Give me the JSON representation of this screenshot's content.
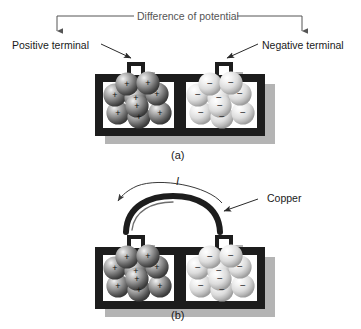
{
  "figure": {
    "title_text": "Difference of potential",
    "background_color": "#ffffff"
  },
  "panel_a": {
    "caption": "(a)",
    "bracket_label": "Difference of potential",
    "left_terminal_label": "Positive terminal",
    "right_terminal_label": "Negative terminal",
    "left_cell": {
      "charge_symbol": "+",
      "sphere_count": 9,
      "sphere_color": "#8c8c8c",
      "sphere_shade_dark": "#4a4a4a",
      "sphere_highlight": "#e8e8e8"
    },
    "right_cell": {
      "charge_symbol": "−",
      "sphere_count": 9,
      "sphere_color": "#dcdcdc",
      "sphere_shade_dark": "#9a9a9a",
      "sphere_highlight": "#ffffff"
    },
    "case_color": "#1d1d1d",
    "shadow_color": "#b4b4b4"
  },
  "panel_b": {
    "caption": "(b)",
    "wire_label": "Copper",
    "current_label": "I",
    "wire_color": "#1d1d1d",
    "left_cell": {
      "charge_symbol": "+",
      "sphere_count": 9,
      "sphere_color": "#8c8c8c",
      "sphere_shade_dark": "#4a4a4a",
      "sphere_highlight": "#e8e8e8"
    },
    "right_cell": {
      "charge_symbol": "−",
      "sphere_count": 9,
      "sphere_color": "#dcdcdc",
      "sphere_shade_dark": "#9a9a9a",
      "sphere_highlight": "#ffffff"
    },
    "case_color": "#1d1d1d",
    "shadow_color": "#b4b4b4"
  },
  "colors": {
    "line": "#555555",
    "text": "#1a1a1a",
    "case": "#1d1d1d"
  }
}
